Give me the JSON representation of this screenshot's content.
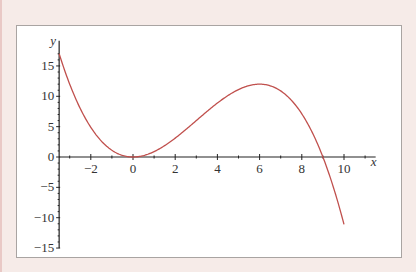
{
  "chart_data": {
    "type": "line",
    "title": "",
    "xlabel": "x",
    "ylabel": "y",
    "function": "y = x^2 (9 - x) / 9",
    "xlim": [
      -3.5,
      11.5
    ],
    "ylim": [
      -15,
      18
    ],
    "x_ticks": [
      -2,
      0,
      2,
      4,
      6,
      8,
      10
    ],
    "y_ticks": [
      -15,
      -10,
      -5,
      0,
      5,
      10,
      15
    ],
    "x_tick_labels": [
      "−2",
      "0",
      "2",
      "4",
      "6",
      "8",
      "10"
    ],
    "y_tick_labels": [
      "−15",
      "−10",
      "−5",
      "0",
      "5",
      "10",
      "15"
    ],
    "grid": false,
    "legend": null,
    "series": [
      {
        "name": "f(x)",
        "color": "#c0504d",
        "x": [
          -3.5,
          -3,
          -2.5,
          -2,
          -1.5,
          -1,
          -0.5,
          0,
          0.5,
          1,
          1.5,
          2,
          2.5,
          3,
          3.5,
          4,
          4.5,
          5,
          5.5,
          6,
          6.5,
          7,
          7.5,
          8,
          8.5,
          9,
          9.5,
          10
        ],
        "y": [
          17.0,
          12.0,
          8.0,
          4.9,
          2.8,
          1.1,
          0.3,
          0,
          0.2,
          0.9,
          1.9,
          3.1,
          4.5,
          6.0,
          7.5,
          8.9,
          10.1,
          11.1,
          11.8,
          12.0,
          11.7,
          10.9,
          9.4,
          7.1,
          4.0,
          0,
          -5.0,
          -11.1
        ]
      }
    ]
  }
}
